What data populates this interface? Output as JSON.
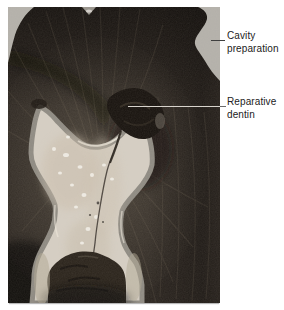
{
  "figure": {
    "labels": [
      {
        "id": "cavity-preparation",
        "text": "Cavity preparation"
      },
      {
        "id": "reparative-dentin",
        "text": "Reparative dentin"
      }
    ],
    "colors": {
      "page_background": "#ffffff",
      "dentin_base": "#2a241f",
      "cavity_light": "#b3b0aa",
      "pulp_fill": "#d5cec3",
      "pulp_rim": "#8e8a82",
      "reparative_mass": "#17120e",
      "label_text": "#222222",
      "leader_dark": "#3f3f3f",
      "leader_light": "#d8d4cd"
    }
  }
}
